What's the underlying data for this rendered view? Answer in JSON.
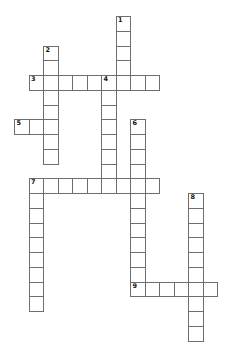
{
  "page": {
    "background": "#ffffff",
    "width": 230,
    "height": 362
  },
  "puzzle": {
    "type": "crossword",
    "grid": {
      "origin_x": 14,
      "origin_y": 16,
      "cell_width": 14.5,
      "cell_height": 14.75,
      "line_color": "#6e6e6e",
      "cell_fill": "#ffffff",
      "number_color": "#111111"
    },
    "words": [
      {
        "number": "1",
        "direction": "down",
        "col": 7,
        "row": 0,
        "length": 5
      },
      {
        "number": "2",
        "direction": "down",
        "col": 2,
        "row": 2,
        "length": 8
      },
      {
        "number": "3",
        "direction": "across",
        "col": 1,
        "row": 4,
        "length": 9
      },
      {
        "number": "4",
        "direction": "down",
        "col": 6,
        "row": 4,
        "length": 8
      },
      {
        "number": "5",
        "direction": "across",
        "col": 0,
        "row": 7,
        "length": 3
      },
      {
        "number": "6",
        "direction": "down",
        "col": 8,
        "row": 7,
        "length": 12
      },
      {
        "number": "7",
        "direction": "across",
        "col": 1,
        "row": 11,
        "length": 9
      },
      {
        "number": "7",
        "direction": "down",
        "col": 1,
        "row": 11,
        "length": 9
      },
      {
        "number": "8",
        "direction": "down",
        "col": 12,
        "row": 12,
        "length": 10
      },
      {
        "number": "9",
        "direction": "across",
        "col": 8,
        "row": 18,
        "length": 6
      }
    ]
  }
}
